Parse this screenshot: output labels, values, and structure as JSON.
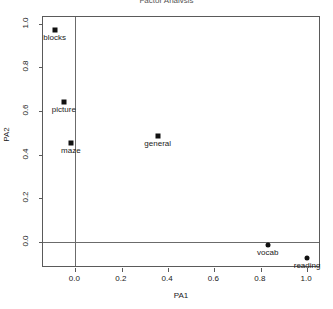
{
  "chart_data": {
    "type": "scatter",
    "title": "Factor Analysis",
    "xlabel": "PA1",
    "ylabel": "PA2",
    "xlim": [
      -0.14,
      1.06
    ],
    "ylim": [
      -0.12,
      1.03
    ],
    "grid": false,
    "legend": null,
    "reference_lines": {
      "x": 0.0,
      "y": 0.0
    },
    "xticks": [
      "0.0",
      "0.2",
      "0.4",
      "0.6",
      "0.8",
      "1.0"
    ],
    "xtick_values": [
      0.0,
      0.2,
      0.4,
      0.6,
      0.8,
      1.0
    ],
    "yticks": [
      "0.0",
      "0.2",
      "0.4",
      "0.6",
      "0.8",
      "1.0"
    ],
    "ytick_values": [
      0.0,
      0.2,
      0.4,
      0.6,
      0.8,
      1.0
    ],
    "points": [
      {
        "label": "blocks",
        "x": -0.09,
        "y": 0.97,
        "marker": "square"
      },
      {
        "label": "picture",
        "x": -0.05,
        "y": 0.64,
        "marker": "square"
      },
      {
        "label": "maze",
        "x": -0.02,
        "y": 0.455,
        "marker": "square"
      },
      {
        "label": "general",
        "x": 0.355,
        "y": 0.485,
        "marker": "square"
      },
      {
        "label": "vocab",
        "x": 0.83,
        "y": -0.015,
        "marker": "circle"
      },
      {
        "label": "reading",
        "x": 1.0,
        "y": -0.075,
        "marker": "circle"
      }
    ]
  },
  "colors": {
    "marker": "#111111",
    "frame": "#5a5a5a",
    "reference_line": "#6b6b6b",
    "text": "#1a1a1a",
    "background": "#ffffff"
  }
}
